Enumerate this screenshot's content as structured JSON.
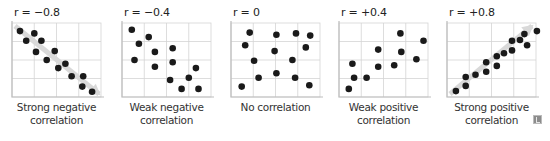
{
  "chart_data": [
    {
      "type": "scatter",
      "title": "r = −0.8",
      "caption": [
        "Strong negative",
        "correlation"
      ],
      "xlabel": "",
      "ylabel": "",
      "grid": true,
      "trend_arrow": "down-right",
      "points": [
        [
          0.09,
          0.89
        ],
        [
          0.16,
          0.76
        ],
        [
          0.25,
          0.86
        ],
        [
          0.33,
          0.76
        ],
        [
          0.27,
          0.61
        ],
        [
          0.39,
          0.5
        ],
        [
          0.48,
          0.62
        ],
        [
          0.52,
          0.39
        ],
        [
          0.6,
          0.45
        ],
        [
          0.67,
          0.28
        ],
        [
          0.8,
          0.28
        ],
        [
          0.79,
          0.14
        ],
        [
          0.9,
          0.07
        ]
      ]
    },
    {
      "type": "scatter",
      "title": "r = −0.4",
      "caption": [
        "Weak negative",
        "correlation"
      ],
      "xlabel": "",
      "ylabel": "",
      "grid": true,
      "points": [
        [
          0.11,
          0.91
        ],
        [
          0.3,
          0.81
        ],
        [
          0.19,
          0.72
        ],
        [
          0.37,
          0.61
        ],
        [
          0.57,
          0.66
        ],
        [
          0.14,
          0.5
        ],
        [
          0.37,
          0.41
        ],
        [
          0.57,
          0.47
        ],
        [
          0.83,
          0.39
        ],
        [
          0.54,
          0.23
        ],
        [
          0.75,
          0.26
        ],
        [
          0.67,
          0.11
        ],
        [
          0.86,
          0.11
        ]
      ]
    },
    {
      "type": "scatter",
      "title": "r = 0",
      "caption": [
        "No correlation"
      ],
      "xlabel": "",
      "ylabel": "",
      "grid": true,
      "points": [
        [
          0.21,
          0.87
        ],
        [
          0.51,
          0.84
        ],
        [
          0.73,
          0.86
        ],
        [
          0.89,
          0.83
        ],
        [
          0.16,
          0.7
        ],
        [
          0.49,
          0.62
        ],
        [
          0.84,
          0.67
        ],
        [
          0.26,
          0.49
        ],
        [
          0.69,
          0.5
        ],
        [
          0.51,
          0.32
        ],
        [
          0.31,
          0.26
        ],
        [
          0.72,
          0.26
        ],
        [
          0.12,
          0.14
        ],
        [
          0.88,
          0.16
        ]
      ]
    },
    {
      "type": "scatter",
      "title": "r = +0.4",
      "caption": [
        "Weak positive",
        "correlation"
      ],
      "xlabel": "",
      "ylabel": "",
      "grid": true,
      "points": [
        [
          0.69,
          0.86
        ],
        [
          0.95,
          0.76
        ],
        [
          0.44,
          0.64
        ],
        [
          0.7,
          0.61
        ],
        [
          0.87,
          0.51
        ],
        [
          0.15,
          0.45
        ],
        [
          0.44,
          0.41
        ],
        [
          0.62,
          0.43
        ],
        [
          0.17,
          0.26
        ],
        [
          0.31,
          0.26
        ],
        [
          0.11,
          0.11
        ]
      ]
    },
    {
      "type": "scatter",
      "title": "r = +0.8",
      "caption": [
        "Strong positive",
        "correlation"
      ],
      "xlabel": "",
      "ylabel": "",
      "grid": true,
      "trend_arrow": "up-right",
      "points": [
        [
          1.01,
          0.89
        ],
        [
          0.87,
          0.85
        ],
        [
          0.73,
          0.76
        ],
        [
          0.82,
          0.77
        ],
        [
          0.9,
          0.7
        ],
        [
          0.64,
          0.59
        ],
        [
          0.73,
          0.63
        ],
        [
          0.56,
          0.55
        ],
        [
          0.44,
          0.47
        ],
        [
          0.56,
          0.42
        ],
        [
          0.44,
          0.34
        ],
        [
          0.32,
          0.3
        ],
        [
          0.21,
          0.27
        ],
        [
          0.21,
          0.15
        ],
        [
          0.1,
          0.08
        ]
      ]
    }
  ],
  "style": {
    "dot_color": "#1a1a1a",
    "grid_color": "#d4d4d4",
    "axis_color": "#bdbdbd",
    "trend_color": "#d9d9d9"
  },
  "corner_icon": "image-credit-icon"
}
